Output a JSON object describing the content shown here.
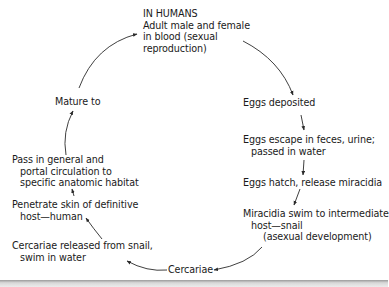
{
  "diagram": {
    "stages": [
      {
        "id": "humans",
        "lines": [
          "IN HUMANS",
          "Adult male and female",
          "in blood (sexual",
          "reproduction)"
        ]
      },
      {
        "id": "eggs-deposited",
        "lines": [
          "Eggs deposited"
        ]
      },
      {
        "id": "eggs-escape",
        "lines": [
          "Eggs escape in feces, urine;",
          "passed in water"
        ]
      },
      {
        "id": "eggs-hatch",
        "lines": [
          "Eggs hatch, release miracidia"
        ]
      },
      {
        "id": "miracidia",
        "lines": [
          "Miracidia swim to intermediate",
          "host—snail",
          "(asexual development)"
        ]
      },
      {
        "id": "cercariae",
        "lines": [
          "Cercariae"
        ]
      },
      {
        "id": "cercariae-released",
        "lines": [
          "Cercariae released from snail,",
          "swim in water"
        ]
      },
      {
        "id": "penetrate",
        "lines": [
          "Penetrate skin of definitive",
          "host—human"
        ]
      },
      {
        "id": "pass-circulation",
        "lines": [
          "Pass in general and",
          "portal circulation to",
          "specific anatomic habitat"
        ]
      },
      {
        "id": "mature",
        "lines": [
          "Mature to"
        ]
      }
    ],
    "flow": [
      "humans",
      "eggs-deposited",
      "eggs-escape",
      "eggs-hatch",
      "miracidia",
      "cercariae",
      "cercariae-released",
      "penetrate",
      "pass-circulation",
      "mature",
      "humans"
    ],
    "colors": {
      "text": "#1a1a1a",
      "arrow": "#2a2a2a",
      "background": "#ffffff"
    }
  }
}
